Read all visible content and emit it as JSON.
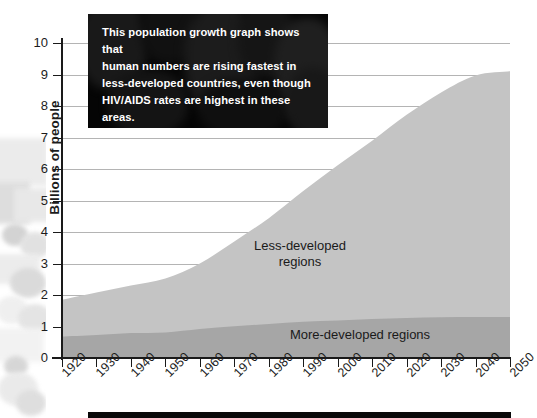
{
  "chart_data": {
    "type": "area",
    "title": "",
    "subtitle": "",
    "xlabel": "",
    "ylabel": "Billions of people",
    "stacked": true,
    "grid": true,
    "legend_position": "in-plot",
    "xlim": [
      1920,
      2050
    ],
    "ylim": [
      0,
      10
    ],
    "x": [
      1920,
      1930,
      1940,
      1950,
      1960,
      1970,
      1980,
      1990,
      2000,
      2010,
      2020,
      2030,
      2040,
      2050
    ],
    "xtick_labels": [
      "1920",
      "1930",
      "1940",
      "1950",
      "1960",
      "1970",
      "1980",
      "1990",
      "2000",
      "2010",
      "2020",
      "2030",
      "2040",
      "2050"
    ],
    "ytick_labels": [
      "0",
      "1",
      "2",
      "3",
      "4",
      "5",
      "6",
      "7",
      "8",
      "9",
      "10"
    ],
    "series": [
      {
        "name": "More-developed regions",
        "color": "#a6a6a6",
        "values": [
          0.68,
          0.73,
          0.79,
          0.81,
          0.92,
          1.01,
          1.08,
          1.15,
          1.19,
          1.24,
          1.27,
          1.29,
          1.3,
          1.3
        ]
      },
      {
        "name": "Less-developed regions",
        "color": "#c4c4c4",
        "values": [
          1.17,
          1.35,
          1.51,
          1.71,
          2.08,
          2.69,
          3.36,
          4.15,
          4.93,
          5.66,
          6.45,
          7.14,
          7.67,
          7.8
        ]
      }
    ],
    "totals": [
      1.85,
      2.08,
      2.3,
      2.52,
      3.0,
      3.7,
      4.44,
      5.3,
      6.12,
      6.9,
      7.72,
      8.43,
      8.97,
      9.1
    ],
    "annotations": [
      {
        "text": "Less-developed",
        "text2": "regions",
        "series": "Less-developed regions"
      },
      {
        "text": "More-developed regions",
        "series": "More-developed regions"
      }
    ]
  },
  "axis": {
    "y_title": "Billions of people",
    "y_ticks": [
      "10",
      "9",
      "8",
      "7",
      "6",
      "5",
      "4",
      "3",
      "2",
      "1",
      "0"
    ],
    "x_ticks": [
      "1920",
      "1930",
      "1940",
      "1950",
      "1960",
      "1970",
      "1980",
      "1990",
      "2000",
      "2010",
      "2020",
      "2030",
      "2040",
      "2050"
    ]
  },
  "series_labels": {
    "less_line1": "Less-developed",
    "less_line2": "regions",
    "more": "More-developed regions"
  },
  "caption": {
    "body": "This population growth graph shows that\nhuman numbers are rising fastest in\nless-developed countries, even though\nHIV/AIDS rates are highest in these areas.",
    "source": "United Nations Population Division, 2007"
  },
  "colors": {
    "less_developed": "#c4c4c4",
    "more_developed": "#a6a6a6",
    "gridline": "#b4b4b4",
    "axis": "#1a1a1a",
    "caption_bg": "#050505",
    "text": "#1c1c1c"
  }
}
